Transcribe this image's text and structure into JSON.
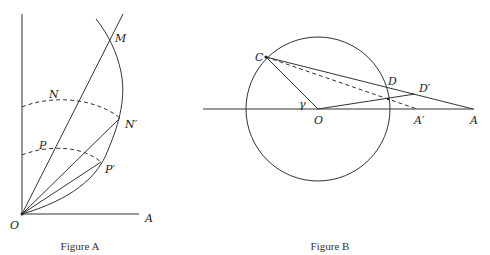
{
  "figure_a": {
    "caption": "Figure A",
    "labels": {
      "M": "M",
      "N": "N",
      "N_prime": "N′",
      "P": "P",
      "P_prime": "P′",
      "O": "O",
      "A": "A"
    }
  },
  "figure_b": {
    "caption": "Figure B",
    "labels": {
      "C": "C",
      "D": "D",
      "D_prime": "D′",
      "O": "O",
      "A_prime": "A′",
      "A": "A",
      "gamma": "γ"
    }
  },
  "colors": {
    "stroke": "#333333",
    "background": "#ffffff"
  }
}
